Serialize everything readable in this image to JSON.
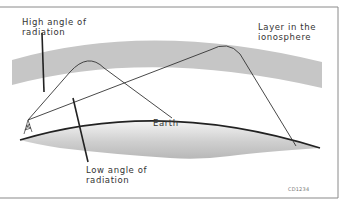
{
  "diagram": {
    "labels": {
      "high_angle": "High angle of\nradiation",
      "layer": "Layer in the\nionosphere",
      "earth": "Earth",
      "low_angle": "Low angle of\nradiation"
    },
    "figure_code": "CD1234",
    "colors": {
      "ionosphere_band": "#c6c6c6",
      "earth_fill_light": "#f2f2f2",
      "earth_fill_dark": "#bdbdbd",
      "ray_line": "#333333",
      "frame": "#8a8a8a"
    }
  }
}
